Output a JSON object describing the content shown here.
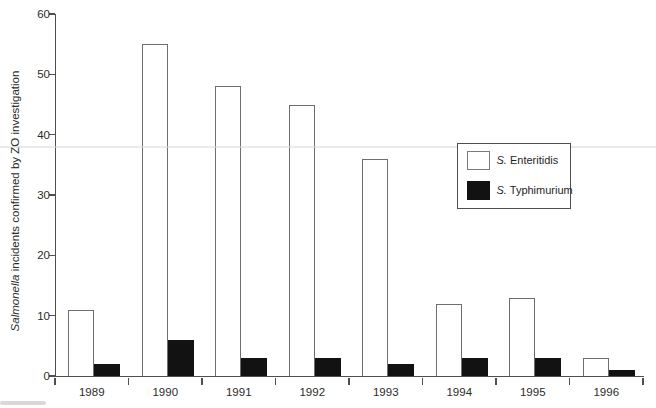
{
  "chart_data": {
    "type": "bar",
    "title": "",
    "categories": [
      "1989",
      "1990",
      "1991",
      "1992",
      "1993",
      "1994",
      "1995",
      "1996"
    ],
    "series": [
      {
        "name": "S. Enteritidis",
        "genus": "S.",
        "species_label": " Enteritidis",
        "fill": "#ffffff",
        "outline": "#6e6e6e",
        "values": [
          11,
          55,
          48,
          45,
          36,
          12,
          13,
          3
        ]
      },
      {
        "name": "S. Typhimurium",
        "genus": "S.",
        "species_label": " Typhimurium",
        "fill": "#121212",
        "outline": "#121212",
        "values": [
          2,
          6,
          3,
          3,
          2,
          3,
          3,
          1
        ]
      }
    ],
    "xlabel": "",
    "ylabel": "Salmonella incidents confirmed by ZO investigation",
    "ylabel_italic": "Salmonella",
    "ylabel_rest": " incidents confirmed by ZO investigation",
    "y_ticks": [
      0,
      10,
      20,
      30,
      40,
      50,
      60
    ],
    "ylim": [
      0,
      60
    ],
    "grid": false,
    "legend_position": "center-right"
  },
  "colors": {
    "axis": "#4f4f4f",
    "text": "#2b2b2b",
    "bar_outline": "#6e6e6e",
    "bar_black": "#121212",
    "legend_border": "#4f4f4f"
  }
}
